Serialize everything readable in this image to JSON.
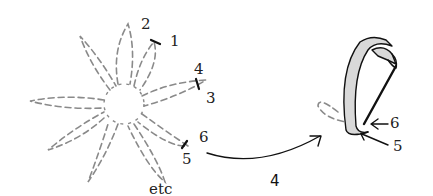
{
  "diagram": {
    "type": "ribbon-embroidery-stitch-diagram",
    "left_figure": {
      "description": "Dashed petal loops radiating around central circle",
      "petal_count": 10,
      "labels": [
        {
          "text": "2",
          "x": 141,
          "y": 29
        },
        {
          "text": "1",
          "x": 170,
          "y": 46
        },
        {
          "text": "4",
          "x": 194,
          "y": 74
        },
        {
          "text": "3",
          "x": 206,
          "y": 103
        },
        {
          "text": "6",
          "x": 199,
          "y": 142
        },
        {
          "text": "5",
          "x": 182,
          "y": 164
        },
        {
          "text": "etc",
          "x": 149,
          "y": 194
        }
      ]
    },
    "arrow": {
      "label": "4",
      "label_x": 70,
      "label_y": 186
    },
    "right_figure": {
      "description": "Ribbon loop pulled up through fabric with needle",
      "labels": [
        {
          "text": "6",
          "x": 390,
          "y": 128
        },
        {
          "text": "5",
          "x": 393,
          "y": 151
        }
      ]
    },
    "colors": {
      "dashed_stroke": "#8a8a8a",
      "ink": "#111111",
      "ribbon_fill": "#d9d9d9",
      "background": "#ffffff"
    }
  }
}
